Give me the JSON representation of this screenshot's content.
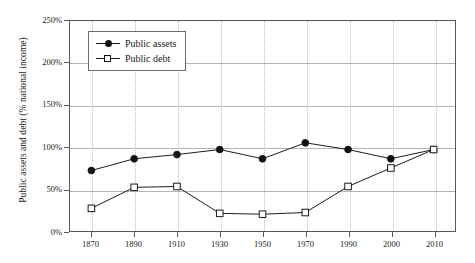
{
  "chart_data": {
    "type": "line",
    "title": "",
    "xlabel": "",
    "ylabel": "Public assets and debt (% national income)",
    "categories": [
      "1870",
      "1890",
      "1910",
      "1930",
      "1950",
      "1970",
      "1990",
      "2000",
      "2010"
    ],
    "series": [
      {
        "name": "Public assets",
        "marker": "filled-circle",
        "values": [
          72,
          86,
          91,
          97,
          86,
          105,
          97,
          86,
          97
        ]
      },
      {
        "name": "Public debt",
        "marker": "open-square",
        "values": [
          27,
          52,
          53,
          21,
          20,
          22,
          53,
          75,
          97
        ]
      }
    ],
    "ylim": [
      0,
      250
    ],
    "ytick_values": [
      0,
      50,
      100,
      150,
      200,
      250
    ],
    "ytick_labels": [
      "0%",
      "50%",
      "100%",
      "150%",
      "200%",
      "250%"
    ],
    "grid": {
      "horizontal": true,
      "vertical": true,
      "horizontal_style": "solid",
      "vertical_style": "dotted"
    },
    "legend": {
      "position": "top-left-inside",
      "entries": [
        "Public assets",
        "Public debt"
      ]
    },
    "colors": {
      "line": "#1a1a1a",
      "marker_fill": "#111111",
      "marker_open_fill": "#ffffff",
      "frame": "#585858",
      "hgrid": "#b4b4b4",
      "vgrid": "#bdbdbd",
      "background": "#ffffff"
    }
  }
}
